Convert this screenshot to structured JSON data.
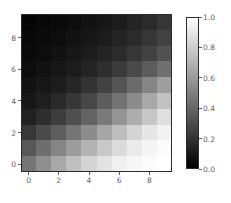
{
  "chart_data": {
    "type": "heatmap",
    "title": "",
    "xlabel": "",
    "ylabel": "",
    "cmap": "gray",
    "vmin": 0.0,
    "vmax": 1.0,
    "grid": false,
    "origin": "upper",
    "x": [
      0,
      1,
      2,
      3,
      4,
      5,
      6,
      7,
      8,
      9
    ],
    "y": [
      0,
      1,
      2,
      3,
      4,
      5,
      6,
      7,
      8,
      9
    ],
    "xticks": [
      0,
      2,
      4,
      6,
      8
    ],
    "xtick_labels": [
      "0",
      "2",
      "4",
      "6",
      "8"
    ],
    "yticks": [
      0,
      2,
      4,
      6,
      8
    ],
    "ytick_labels": [
      "0",
      "2",
      "4",
      "6",
      "8"
    ],
    "xlim": [
      -0.5,
      9.5
    ],
    "ylim": [
      9.5,
      -0.5
    ],
    "values": [
      [
        0.02,
        0.03,
        0.04,
        0.05,
        0.07,
        0.09,
        0.11,
        0.14,
        0.17,
        0.21
      ],
      [
        0.03,
        0.04,
        0.05,
        0.07,
        0.09,
        0.11,
        0.14,
        0.17,
        0.21,
        0.26
      ],
      [
        0.04,
        0.05,
        0.07,
        0.09,
        0.11,
        0.14,
        0.17,
        0.21,
        0.26,
        0.32
      ],
      [
        0.05,
        0.07,
        0.09,
        0.11,
        0.14,
        0.18,
        0.23,
        0.29,
        0.36,
        0.44
      ],
      [
        0.07,
        0.09,
        0.11,
        0.15,
        0.2,
        0.26,
        0.33,
        0.42,
        0.52,
        0.62
      ],
      [
        0.09,
        0.12,
        0.16,
        0.21,
        0.28,
        0.36,
        0.45,
        0.55,
        0.66,
        0.76
      ],
      [
        0.13,
        0.18,
        0.24,
        0.31,
        0.39,
        0.48,
        0.58,
        0.68,
        0.78,
        0.87
      ],
      [
        0.22,
        0.29,
        0.37,
        0.46,
        0.55,
        0.65,
        0.74,
        0.83,
        0.9,
        0.95
      ],
      [
        0.34,
        0.43,
        0.52,
        0.61,
        0.7,
        0.79,
        0.86,
        0.92,
        0.96,
        0.99
      ],
      [
        0.46,
        0.56,
        0.66,
        0.75,
        0.83,
        0.89,
        0.94,
        0.97,
        0.99,
        1.0
      ]
    ],
    "colorbar": {
      "orientation": "vertical",
      "ticks": [
        0.0,
        0.2,
        0.4,
        0.6,
        0.8,
        1.0
      ],
      "tick_labels": [
        "0.0",
        "0.2",
        "0.4",
        "0.6",
        "0.8",
        "1.0"
      ],
      "vmin": 0.0,
      "vmax": 1.0
    }
  },
  "colors": {
    "background": "#ffffff",
    "tick_text": "#5f5f5f",
    "spine": "#2b2b2b",
    "cmap_low": "#000000",
    "cmap_high": "#ffffff"
  }
}
